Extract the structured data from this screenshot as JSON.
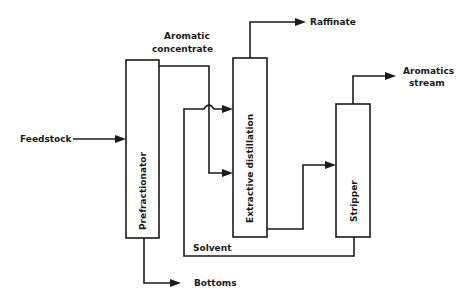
{
  "diagram": {
    "type": "process flow diagram",
    "units": [
      {
        "id": "prefractionator",
        "label": "Prefractionator"
      },
      {
        "id": "extractive_distillation",
        "label": "Extractive distillation"
      },
      {
        "id": "stripper",
        "label": "Stripper"
      }
    ],
    "streams": {
      "feedstock": "Feedstock",
      "aromatic_concentrate_line1": "Aromatic",
      "aromatic_concentrate_line2": "concentrate",
      "raffinate": "Raffinate",
      "aromatics_stream_line1": "Aromatics",
      "aromatics_stream_line2": "stream",
      "solvent": "Solvent",
      "bottoms": "Bottoms"
    },
    "connections": [
      {
        "from": "Feedstock",
        "to": "Prefractionator"
      },
      {
        "from": "Prefractionator",
        "to": "Extractive distillation",
        "label": "Aromatic concentrate"
      },
      {
        "from": "Prefractionator",
        "to": "Bottoms"
      },
      {
        "from": "Extractive distillation",
        "to": "Raffinate"
      },
      {
        "from": "Extractive distillation",
        "to": "Stripper"
      },
      {
        "from": "Stripper",
        "to": "Aromatics stream"
      },
      {
        "from": "Stripper",
        "to": "Extractive distillation",
        "label": "Solvent"
      }
    ],
    "colors": {
      "ink": "#1a1a1a",
      "background": "#ffffff"
    }
  }
}
